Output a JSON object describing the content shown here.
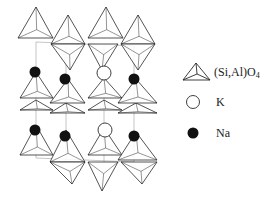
{
  "diagram": {
    "type": "crystal-structure",
    "colors": {
      "line": "#2a2a2a",
      "thin_line": "#9a9a9a",
      "na_fill": "#111111",
      "k_fill": "#ffffff"
    },
    "tetrahedra_up": [
      [
        [
          36,
          7
        ],
        [
          18,
          38
        ],
        [
          53,
          38
        ]
      ],
      [
        [
          68,
          15
        ],
        [
          51,
          44
        ],
        [
          85,
          44
        ]
      ],
      [
        [
          106,
          7
        ],
        [
          88,
          38
        ],
        [
          123,
          38
        ]
      ],
      [
        [
          138,
          15
        ],
        [
          121,
          44
        ],
        [
          155,
          44
        ]
      ],
      [
        [
          36,
          100
        ],
        [
          20,
          110
        ],
        [
          53,
          110
        ]
      ],
      [
        [
          66,
          103
        ],
        [
          50,
          113
        ],
        [
          85,
          113
        ]
      ],
      [
        [
          36,
          125
        ],
        [
          20,
          155
        ],
        [
          53,
          155
        ]
      ],
      [
        [
          66,
          130
        ],
        [
          50,
          162
        ],
        [
          85,
          162
        ]
      ],
      [
        [
          104,
          100
        ],
        [
          88,
          110
        ],
        [
          122,
          110
        ]
      ],
      [
        [
          136,
          103
        ],
        [
          118,
          113
        ],
        [
          157,
          113
        ]
      ],
      [
        [
          104,
          128
        ],
        [
          88,
          155
        ],
        [
          122,
          155
        ]
      ],
      [
        [
          136,
          132
        ],
        [
          118,
          160
        ],
        [
          157,
          160
        ]
      ]
    ],
    "tetrahedra_down": [
      [
        [
          51,
          44
        ],
        [
          85,
          44
        ],
        [
          70,
          70
        ]
      ],
      [
        [
          88,
          44
        ],
        [
          118,
          44
        ],
        [
          102,
          70
        ]
      ],
      [
        [
          121,
          44
        ],
        [
          155,
          44
        ],
        [
          138,
          70
        ]
      ],
      [
        [
          20,
          98
        ],
        [
          53,
          98
        ],
        [
          36,
          72
        ]
      ],
      [
        [
          50,
          103
        ],
        [
          85,
          103
        ],
        [
          68,
          79
        ]
      ],
      [
        [
          88,
          98
        ],
        [
          122,
          98
        ],
        [
          104,
          78
        ]
      ],
      [
        [
          118,
          103
        ],
        [
          157,
          103
        ],
        [
          136,
          79
        ]
      ],
      [
        [
          50,
          162
        ],
        [
          85,
          162
        ],
        [
          72,
          184
        ]
      ],
      [
        [
          88,
          162
        ],
        [
          118,
          162
        ],
        [
          102,
          191
        ]
      ],
      [
        [
          121,
          162
        ],
        [
          157,
          162
        ],
        [
          142,
          184
        ]
      ]
    ],
    "unit_cell_lines": [
      [
        [
          36,
          42
        ],
        [
          36,
          158
        ]
      ],
      [
        [
          66,
          46
        ],
        [
          66,
          162
        ]
      ],
      [
        [
          104,
          46
        ],
        [
          104,
          162
        ]
      ],
      [
        [
          134,
          46
        ],
        [
          134,
          162
        ]
      ],
      [
        [
          36,
          42
        ],
        [
          134,
          46
        ]
      ],
      [
        [
          36,
          158
        ],
        [
          134,
          162
        ]
      ]
    ],
    "atoms": [
      {
        "species": "Na",
        "x": 35,
        "y": 72,
        "r": 5.5
      },
      {
        "species": "Na",
        "x": 65,
        "y": 79,
        "r": 5.5
      },
      {
        "species": "K",
        "x": 104,
        "y": 73,
        "r": 7
      },
      {
        "species": "Na",
        "x": 134,
        "y": 79,
        "r": 5.5
      },
      {
        "species": "Na",
        "x": 35,
        "y": 130,
        "r": 5.5
      },
      {
        "species": "Na",
        "x": 65,
        "y": 136,
        "r": 5.5
      },
      {
        "species": "K",
        "x": 105,
        "y": 130,
        "r": 7
      },
      {
        "species": "Na",
        "x": 134,
        "y": 136,
        "r": 5.5
      }
    ]
  },
  "legend": {
    "items": [
      {
        "symbol": "tetrahedron-icon",
        "label_main": "(Si,Al)O",
        "label_sub": "4"
      },
      {
        "symbol": "open-circle-icon",
        "label": "K"
      },
      {
        "symbol": "filled-circle-icon",
        "label": "Na"
      }
    ]
  }
}
